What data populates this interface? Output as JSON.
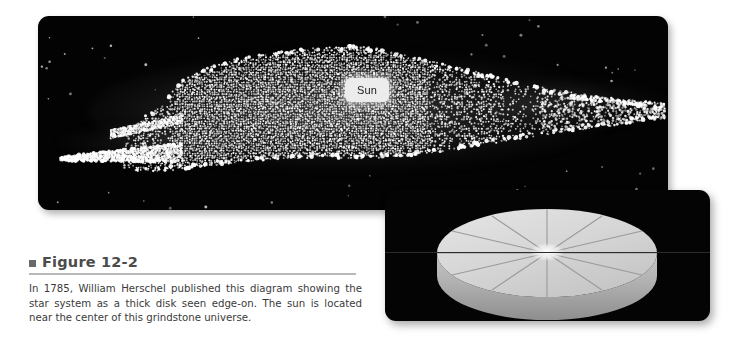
{
  "figure": {
    "panel_bg": "#030303",
    "page_bg": "#ffffff",
    "label_marker": "■",
    "label": "Figure 12-2",
    "caption": "In 1785, William Herschel published this diagram showing the star system as a thick disk seen edge-on. The sun is located near the center of this grindstone universe.",
    "rule_color": "#b9b9b9",
    "label_color": "#4b4b4b"
  },
  "main_diagram": {
    "name": "herschel-star-system-diagram",
    "sun_label": "Sun",
    "sun_label_bg": "#ececec",
    "sun_label_color": "#1a1a1a",
    "star_color": "#ffffff",
    "description": "Edge-on view of the Milky Way star system drawn as a dense irregular cloud of white dots, elongated horizontally, with a cleft at the left end and thinning scattered stars at the right."
  },
  "inset_diagram": {
    "name": "grindstone-disk-inset",
    "panel_bg": "#040404",
    "disk_top_color": "#d9d9d9",
    "disk_rim_color": "#a8a8a8",
    "groove_color": "#8d8d8d",
    "center_highlight_color": "#ffffff",
    "groove_count": 12,
    "description": "A light gray cylindrical grindstone disk shown in perspective with twelve radial grooves converging at a bright highlight in the center."
  }
}
